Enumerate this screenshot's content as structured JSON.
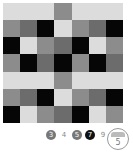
{
  "colors": {
    "L": "#dcdcdc",
    "M": "#8c8c8c",
    "D": "#6c6c6c",
    "B": "#060606"
  },
  "grid": [
    [
      "L",
      "L",
      "L",
      "M",
      "L",
      "L",
      "L"
    ],
    [
      "M",
      "D",
      "B",
      "L",
      "M",
      "D",
      "B"
    ],
    [
      "B",
      "L",
      "M",
      "D",
      "B",
      "L",
      "M"
    ],
    [
      "M",
      "B",
      "D",
      "B",
      "M",
      "B",
      "D"
    ],
    [
      "L",
      "L",
      "L",
      "M",
      "L",
      "L",
      "L"
    ],
    [
      "M",
      "D",
      "B",
      "L",
      "M",
      "D",
      "B"
    ],
    [
      "B",
      "L",
      "M",
      "D",
      "B",
      "L",
      "M"
    ]
  ],
  "size_options": [
    {
      "label": "3",
      "style": "filled"
    },
    {
      "label": "4",
      "style": "plain"
    },
    {
      "label": "5",
      "style": "filled"
    },
    {
      "label": "7",
      "style": "selected"
    },
    {
      "label": "9",
      "style": "plain"
    }
  ],
  "dial": {
    "value": "5"
  }
}
